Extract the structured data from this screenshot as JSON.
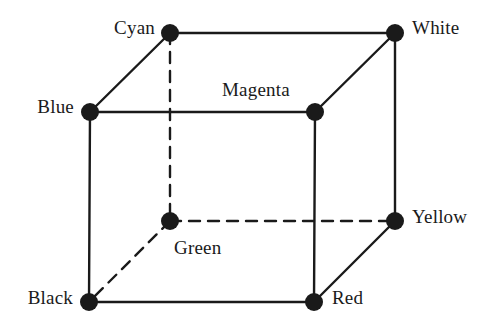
{
  "figure": {
    "name": "rgb-color-cube",
    "width": 500,
    "height": 331,
    "background_color": "#ffffff",
    "ink_color": "#1a1a1a",
    "vertex_radius": 9,
    "edge_width": 2.4,
    "dash_pattern": "11 8"
  },
  "vertices": [
    {
      "id": "cyan",
      "label": "Cyan",
      "x": 170,
      "y": 33,
      "label_x": 155,
      "label_y": 18,
      "label_align": "right"
    },
    {
      "id": "white",
      "label": "White",
      "x": 395,
      "y": 33,
      "label_x": 412,
      "label_y": 18,
      "label_align": "left"
    },
    {
      "id": "blue",
      "label": "Blue",
      "x": 90,
      "y": 112,
      "label_x": 74,
      "label_y": 97,
      "label_align": "right"
    },
    {
      "id": "magenta",
      "label": "Magenta",
      "x": 315,
      "y": 112,
      "label_x": 222,
      "label_y": 80,
      "label_align": "left"
    },
    {
      "id": "green",
      "label": "Green",
      "x": 170,
      "y": 221,
      "label_x": 174,
      "label_y": 238,
      "label_align": "left"
    },
    {
      "id": "yellow",
      "label": "Yellow",
      "x": 395,
      "y": 221,
      "label_x": 412,
      "label_y": 207,
      "label_align": "left"
    },
    {
      "id": "black",
      "label": "Black",
      "x": 89,
      "y": 302,
      "label_x": 73,
      "label_y": 288,
      "label_align": "right"
    },
    {
      "id": "red",
      "label": "Red",
      "x": 314,
      "y": 302,
      "label_x": 332,
      "label_y": 288,
      "label_align": "left"
    }
  ],
  "edges": [
    {
      "id": "cyan-white",
      "from": "cyan",
      "to": "white",
      "style": "solid"
    },
    {
      "id": "cyan-blue",
      "from": "cyan",
      "to": "blue",
      "style": "solid"
    },
    {
      "id": "white-magenta",
      "from": "white",
      "to": "magenta",
      "style": "solid"
    },
    {
      "id": "blue-magenta",
      "from": "blue",
      "to": "magenta",
      "style": "solid"
    },
    {
      "id": "white-yellow",
      "from": "white",
      "to": "yellow",
      "style": "solid"
    },
    {
      "id": "blue-black",
      "from": "blue",
      "to": "black",
      "style": "solid"
    },
    {
      "id": "magenta-red",
      "from": "magenta",
      "to": "red",
      "style": "solid"
    },
    {
      "id": "black-red",
      "from": "black",
      "to": "red",
      "style": "solid"
    },
    {
      "id": "red-yellow",
      "from": "red",
      "to": "yellow",
      "style": "solid"
    },
    {
      "id": "cyan-green",
      "from": "cyan",
      "to": "green",
      "style": "dashed"
    },
    {
      "id": "green-yellow",
      "from": "green",
      "to": "yellow",
      "style": "dashed"
    },
    {
      "id": "green-black",
      "from": "green",
      "to": "black",
      "style": "dashed"
    }
  ]
}
